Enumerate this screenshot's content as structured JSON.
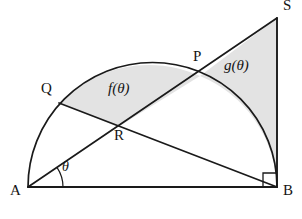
{
  "figure": {
    "type": "geometry-diagram",
    "width": 302,
    "height": 219,
    "background_color": "#ffffff",
    "stroke_color": "#1a1a1a",
    "shade_color": "#e3e3e3",
    "vertices": [
      {
        "key": "A",
        "label": "A",
        "x": 28,
        "y": 187,
        "label_x": 10,
        "label_y": 189
      },
      {
        "key": "B",
        "label": "B",
        "x": 277,
        "y": 187,
        "label_x": 283,
        "label_y": 189
      },
      {
        "key": "S",
        "label": "S",
        "x": 277,
        "y": 18,
        "label_x": 283,
        "label_y": 4
      },
      {
        "key": "P",
        "label": "P",
        "x": 200,
        "y": 76,
        "label_x": 193,
        "label_y": 55
      },
      {
        "key": "Q",
        "label": "Q",
        "x": 59,
        "y": 103,
        "label_x": 41,
        "label_y": 87
      },
      {
        "key": "R",
        "label": "R",
        "x": 118,
        "y": 127,
        "label_x": 114,
        "label_y": 134
      }
    ],
    "regions": [
      {
        "key": "f",
        "label": "f(θ)",
        "label_x": 110,
        "label_y": 86,
        "shaded": true
      },
      {
        "key": "g",
        "label": "g(θ)",
        "label_x": 226,
        "label_y": 63,
        "shaded": true
      }
    ],
    "angle": {
      "label": "θ",
      "label_x": 62,
      "label_y": 165,
      "at_vertex": "A",
      "between": [
        "AB",
        "AS"
      ],
      "degrees": 34.2
    },
    "right_angle": {
      "at_vertex": "B",
      "between": [
        "BA",
        "BS"
      ],
      "size": 14
    },
    "arc": {
      "kind": "semicircle",
      "center_x": 152.5,
      "center_y": 187,
      "radius": 124.5,
      "from": "A",
      "to": "B"
    },
    "segments": [
      {
        "key": "AB",
        "from": "A",
        "to": "B"
      },
      {
        "key": "AS",
        "from": "A",
        "to": "S"
      },
      {
        "key": "SB",
        "from": "S",
        "to": "B"
      },
      {
        "key": "QB",
        "from": "Q",
        "to": "B"
      }
    ]
  }
}
